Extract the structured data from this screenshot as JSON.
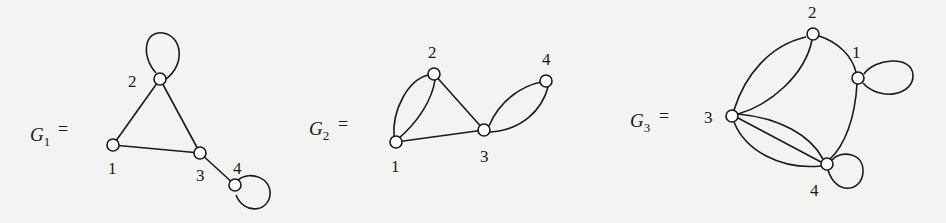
{
  "figure": {
    "graphs": [
      {
        "name": "G",
        "subscript": "1",
        "equals": "=",
        "nodes": [
          {
            "id": "1",
            "label": "1"
          },
          {
            "id": "2",
            "label": "2"
          },
          {
            "id": "3",
            "label": "3"
          },
          {
            "id": "4",
            "label": "4"
          }
        ],
        "edges": [
          {
            "from": "1",
            "to": "2",
            "count": 1
          },
          {
            "from": "2",
            "to": "3",
            "count": 1
          },
          {
            "from": "1",
            "to": "3",
            "count": 1
          },
          {
            "from": "3",
            "to": "4",
            "count": 1
          },
          {
            "from": "2",
            "to": "2",
            "count": 1,
            "type": "loop"
          },
          {
            "from": "4",
            "to": "4",
            "count": 1,
            "type": "loop"
          }
        ]
      },
      {
        "name": "G",
        "subscript": "2",
        "equals": "=",
        "nodes": [
          {
            "id": "1",
            "label": "1"
          },
          {
            "id": "2",
            "label": "2"
          },
          {
            "id": "3",
            "label": "3"
          },
          {
            "id": "4",
            "label": "4"
          }
        ],
        "edges": [
          {
            "from": "1",
            "to": "2",
            "count": 2
          },
          {
            "from": "2",
            "to": "3",
            "count": 1
          },
          {
            "from": "1",
            "to": "3",
            "count": 1
          },
          {
            "from": "3",
            "to": "4",
            "count": 2
          }
        ]
      },
      {
        "name": "G",
        "subscript": "3",
        "equals": "=",
        "nodes": [
          {
            "id": "1",
            "label": "1"
          },
          {
            "id": "2",
            "label": "2"
          },
          {
            "id": "3",
            "label": "3"
          },
          {
            "id": "4",
            "label": "4"
          }
        ],
        "edges": [
          {
            "from": "2",
            "to": "3",
            "count": 2
          },
          {
            "from": "2",
            "to": "1",
            "count": 1
          },
          {
            "from": "1",
            "to": "4",
            "count": 1
          },
          {
            "from": "3",
            "to": "4",
            "count": 3
          },
          {
            "from": "1",
            "to": "1",
            "count": 1,
            "type": "loop"
          },
          {
            "from": "4",
            "to": "4",
            "count": 1,
            "type": "loop"
          }
        ]
      }
    ]
  }
}
